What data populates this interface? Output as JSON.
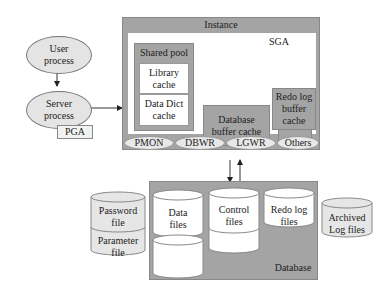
{
  "client": {
    "user_process": "User\nprocess",
    "server_process": "Server\nprocess",
    "pga": "PGA"
  },
  "instance": {
    "title": "Instance",
    "sga": {
      "title": "SGA",
      "shared_pool": {
        "title": "Shared pool",
        "library_cache": "Library\ncache",
        "data_dict_cache": "Data Dict\ncache"
      },
      "database_buffer_cache": "Database\nbuffer cache",
      "redo_log_buffer_cache": "Redo log\nbuffer cache"
    },
    "processes": [
      "PMON",
      "DBWR",
      "LGWR",
      "Others"
    ]
  },
  "database": {
    "title": "Database",
    "files": [
      "Data\nfiles",
      "Control\nfiles",
      "Redo log\nfiles"
    ]
  },
  "external_files": {
    "password_file": "Password\nfile",
    "parameter_file": "Parameter\nfile",
    "archived_log_files": "Archived\nLog files"
  }
}
